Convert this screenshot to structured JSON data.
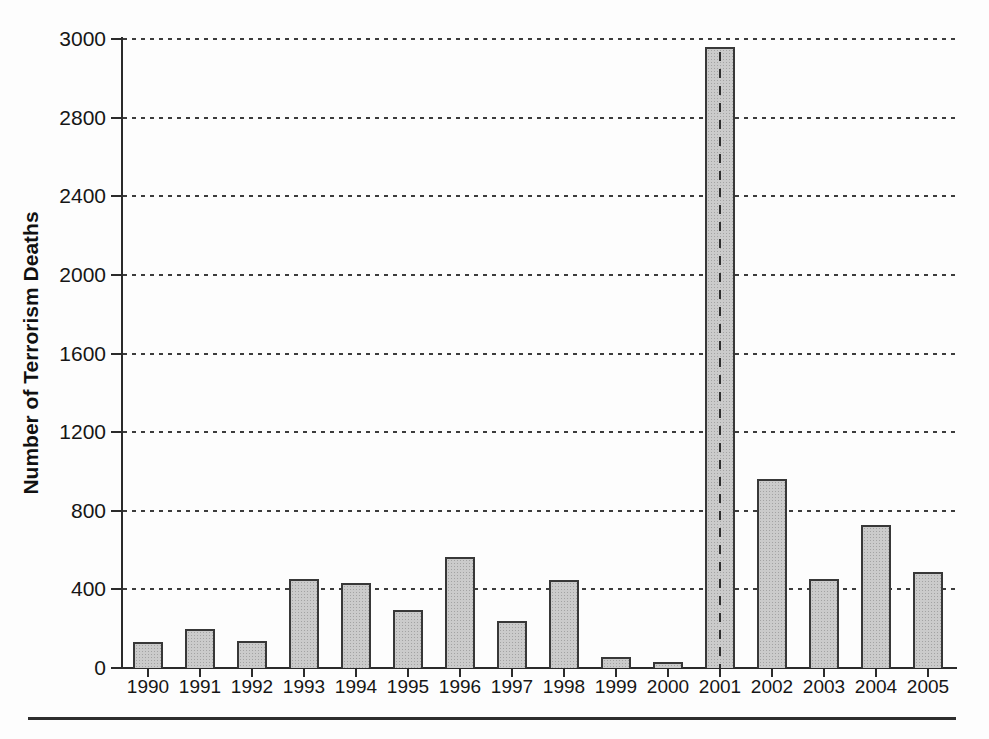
{
  "chart_data": {
    "type": "bar",
    "title": "",
    "xlabel": "",
    "ylabel": "Number of Terrorism Deaths",
    "categories": [
      "1990",
      "1991",
      "1992",
      "1993",
      "1994",
      "1995",
      "1996",
      "1997",
      "1998",
      "1999",
      "2000",
      "2001",
      "2002",
      "2003",
      "2004",
      "2005"
    ],
    "values": [
      130,
      200,
      135,
      455,
      435,
      295,
      565,
      240,
      450,
      55,
      30,
      2980,
      960,
      455,
      730,
      490
    ],
    "yticks": [
      0,
      400,
      800,
      1200,
      1600,
      2000,
      2400,
      2800,
      3000
    ],
    "ylim": [
      0,
      3000
    ],
    "grid": "horizontal dashed gridlines at every y tick above 0",
    "axis_style": "all y ticks equally spaced, including the compressed top interval 2800-3000",
    "legend": "none",
    "highlight": {
      "category": "2001",
      "marker": "vertical dashed line through center of bar"
    }
  },
  "colors": {
    "background": "#fdfdfd",
    "bar_fill": "#cbcbcb",
    "bar_border": "#383838",
    "axis": "#2b2b2b",
    "text": "#161616"
  }
}
